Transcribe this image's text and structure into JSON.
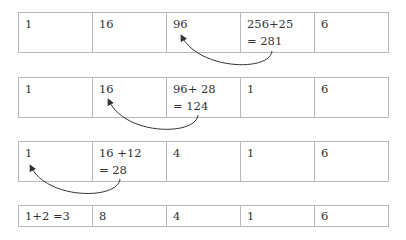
{
  "rows": [
    {
      "cells": [
        "1",
        "16",
        "96",
        "256+25\n= 281",
        "6"
      ]
    },
    {
      "cells": [
        "1",
        "16",
        "96+ 28\n= 124",
        "1",
        "6"
      ]
    },
    {
      "cells": [
        "1",
        "16 +12\n= 28",
        "4",
        "1",
        "6"
      ]
    },
    {
      "cells": [
        "1+2 =3",
        "8",
        "4",
        "1",
        "6"
      ]
    }
  ],
  "arrows": [
    {
      "from": "row1-col4",
      "to": "row1-col3"
    },
    {
      "from": "row2-col3",
      "to": "row2-col2"
    },
    {
      "from": "row3-col2",
      "to": "row3-col1"
    }
  ],
  "colors": {
    "border": "#b8b8b8",
    "text": "#333333",
    "arrow": "#333333"
  }
}
